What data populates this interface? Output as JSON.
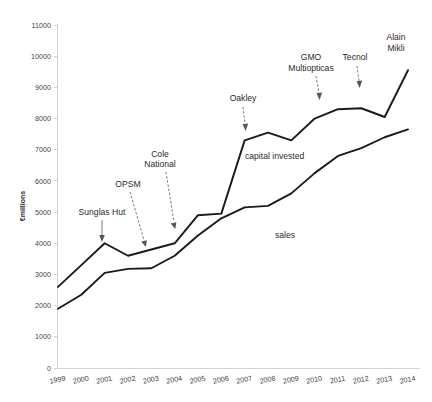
{
  "chart_data": {
    "type": "line",
    "title": "",
    "xlabel": "",
    "ylabel": "€millions",
    "ylim": [
      0,
      11000
    ],
    "ytick_step": 1000,
    "grid": false,
    "legend": "inline-labels",
    "categories": [
      "1999",
      "2000",
      "2001",
      "2002",
      "2003",
      "2004",
      "2005",
      "2006",
      "2007",
      "2008",
      "2009",
      "2010",
      "2011",
      "2012",
      "2013",
      "2014"
    ],
    "series": [
      {
        "name": "capital invested",
        "values": [
          2600,
          3300,
          4000,
          3600,
          3800,
          4000,
          4900,
          4950,
          7300,
          7550,
          7300,
          8000,
          8300,
          8330,
          8050,
          9550
        ]
      },
      {
        "name": "sales",
        "values": [
          1900,
          2350,
          3050,
          3180,
          3200,
          3600,
          4250,
          4800,
          5150,
          5200,
          5600,
          6250,
          6800,
          7050,
          7400,
          7650
        ]
      }
    ],
    "ytick_labels": [
      "0",
      "1000",
      "2000",
      "3000",
      "4000",
      "5000",
      "6000",
      "7000",
      "8000",
      "9000",
      "10000",
      "11000"
    ],
    "annotations": [
      {
        "name": "sunglas-hut",
        "label": "Sunglas Hut",
        "lines": [
          "Sunglas Hut"
        ],
        "target_year": "2001",
        "target_series": "capital invested"
      },
      {
        "name": "opsm",
        "label": "OPSM",
        "lines": [
          "OPSM"
        ],
        "target_year": "2003",
        "target_series": "capital invested"
      },
      {
        "name": "cole-national",
        "label": "Cole National",
        "lines": [
          "Cole",
          "National"
        ],
        "target_year": "2004",
        "target_series": "capital invested"
      },
      {
        "name": "oakley",
        "label": "Oakley",
        "lines": [
          "Oakley"
        ],
        "target_year": "2007",
        "target_series": "capital invested"
      },
      {
        "name": "gmo-multiopticas",
        "label": "GMO Multiopticas",
        "lines": [
          "GMO",
          "Multiopticas"
        ],
        "target_year": "2010",
        "target_series": "capital invested"
      },
      {
        "name": "tecnol",
        "label": "Tecnol",
        "lines": [
          "Tecnol"
        ],
        "target_year": "2012",
        "target_series": "capital invested"
      },
      {
        "name": "alain-mikli",
        "label": "Alain Mikli",
        "lines": [
          "Alain",
          "Mikli"
        ],
        "target_year": "2014",
        "target_series": "capital invested"
      }
    ],
    "series_inline_labels": [
      {
        "name": "capital-invested-label",
        "text": "capital invested"
      },
      {
        "name": "sales-label",
        "text": "sales"
      }
    ],
    "colors": {
      "line": "#1a1a1a",
      "axis": "#d4d4d4",
      "text": "#2a2a2a",
      "tick_text": "#3f3f3f",
      "background": "#ffffff"
    }
  }
}
